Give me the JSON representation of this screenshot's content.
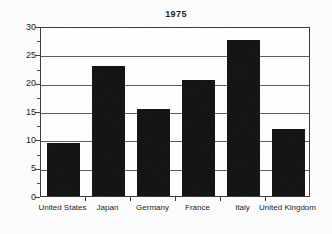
{
  "chart_data": {
    "type": "bar",
    "title": "1975",
    "xlabel": "",
    "ylabel": "",
    "categories": [
      "United States",
      "Japan",
      "Germany",
      "France",
      "Italy",
      "United Kingdom"
    ],
    "values": [
      9.4,
      22.9,
      15.3,
      20.4,
      27.5,
      11.8
    ],
    "ylim": [
      0,
      30
    ],
    "y_major_ticks": [
      0,
      5,
      10,
      15,
      20,
      25,
      30
    ],
    "y_tick_labels": [
      "0",
      "5",
      "10",
      "15",
      "20",
      "25",
      "30"
    ],
    "y_minor_ticks": [
      2.5,
      7.5,
      12.5,
      17.5,
      22.5,
      27.5
    ],
    "grid": "horizontal",
    "legend": "none",
    "bar_color": "#111111",
    "frame_color": "#3a3a3a",
    "gridline_color": "#5a5a5a"
  }
}
